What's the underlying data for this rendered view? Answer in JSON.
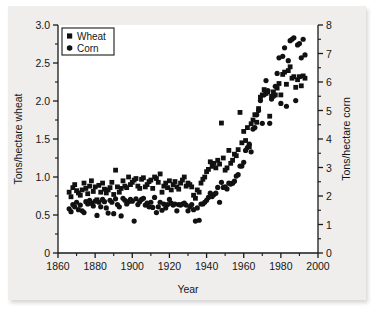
{
  "figure": {
    "background_color": "#efeeec",
    "plot_background_color": "#ffffff",
    "marker_color": "#111111"
  },
  "legend": {
    "position": "top-left-inside",
    "entries": [
      {
        "label": "Wheat",
        "marker": "square"
      },
      {
        "label": "Corn",
        "marker": "circle"
      }
    ]
  },
  "axes": {
    "x": {
      "label": "Year",
      "ticks": [
        "1860",
        "1880",
        "1900",
        "1920",
        "1940",
        "1960",
        "1980",
        "2000"
      ],
      "tick_values": [
        1860,
        1880,
        1900,
        1920,
        1940,
        1960,
        1980,
        2000
      ],
      "minor_step": 10,
      "range": [
        1860,
        2000
      ]
    },
    "y_left": {
      "label": "Tons/hectare wheat",
      "ticks": [
        "0",
        "0.5",
        "1.0",
        "1.5",
        "2.0",
        "2.5",
        "3.0"
      ],
      "tick_values": [
        0,
        0.5,
        1.0,
        1.5,
        2.0,
        2.5,
        3.0
      ],
      "minor_step": 0.25,
      "range": [
        0,
        3.0
      ]
    },
    "y_right": {
      "label": "Tons/hectare corn",
      "ticks": [
        "0",
        "1",
        "2",
        "3",
        "4",
        "5",
        "6",
        "7",
        "8"
      ],
      "tick_values": [
        0,
        1,
        2,
        3,
        4,
        5,
        6,
        7,
        8
      ],
      "minor_step": 0.5,
      "range": [
        0,
        8
      ]
    }
  },
  "chart_data": {
    "type": "scatter",
    "title": "",
    "xlabel": "Year",
    "ylabel": "Tons/hectare wheat",
    "ylabel_secondary": "Tons/hectare corn",
    "xlim": [
      1860,
      2000
    ],
    "ylim": [
      0,
      3.0
    ],
    "ylim_secondary": [
      0,
      8
    ],
    "grid": false,
    "legend_position": "upper left",
    "series": [
      {
        "name": "Wheat",
        "marker": "square",
        "axis": "left",
        "units": "tons/hectare",
        "points": [
          [
            1866,
            0.8
          ],
          [
            1867,
            0.74
          ],
          [
            1868,
            0.86
          ],
          [
            1869,
            0.9
          ],
          [
            1870,
            0.82
          ],
          [
            1871,
            0.79
          ],
          [
            1872,
            0.76
          ],
          [
            1873,
            0.83
          ],
          [
            1874,
            0.92
          ],
          [
            1875,
            0.85
          ],
          [
            1876,
            0.78
          ],
          [
            1877,
            0.88
          ],
          [
            1878,
            0.95
          ],
          [
            1879,
            0.81
          ],
          [
            1880,
            0.87
          ],
          [
            1881,
            0.7
          ],
          [
            1882,
            0.89
          ],
          [
            1883,
            0.8
          ],
          [
            1884,
            0.92
          ],
          [
            1885,
            0.84
          ],
          [
            1886,
            0.79
          ],
          [
            1887,
            0.83
          ],
          [
            1888,
            0.86
          ],
          [
            1889,
            0.93
          ],
          [
            1890,
            0.77
          ],
          [
            1891,
            1.09
          ],
          [
            1892,
            0.87
          ],
          [
            1893,
            0.8
          ],
          [
            1894,
            0.85
          ],
          [
            1895,
            0.95
          ],
          [
            1896,
            0.88
          ],
          [
            1897,
            0.86
          ],
          [
            1898,
            1.0
          ],
          [
            1899,
            0.9
          ],
          [
            1900,
            0.93
          ],
          [
            1901,
            0.96
          ],
          [
            1902,
            0.98
          ],
          [
            1903,
            0.88
          ],
          [
            1904,
            0.85
          ],
          [
            1905,
            0.97
          ],
          [
            1906,
            0.99
          ],
          [
            1907,
            0.87
          ],
          [
            1908,
            0.9
          ],
          [
            1909,
            0.94
          ],
          [
            1910,
            0.96
          ],
          [
            1911,
            0.85
          ],
          [
            1912,
            1.0
          ],
          [
            1913,
            0.98
          ],
          [
            1914,
            0.93
          ],
          [
            1915,
            1.04
          ],
          [
            1916,
            0.8
          ],
          [
            1917,
            0.88
          ],
          [
            1918,
            0.92
          ],
          [
            1919,
            0.86
          ],
          [
            1920,
            0.95
          ],
          [
            1921,
            0.83
          ],
          [
            1922,
            0.9
          ],
          [
            1923,
            0.94
          ],
          [
            1924,
            0.87
          ],
          [
            1925,
            0.84
          ],
          [
            1926,
            0.92
          ],
          [
            1927,
            0.96
          ],
          [
            1928,
            1.0
          ],
          [
            1929,
            0.88
          ],
          [
            1930,
            0.92
          ],
          [
            1931,
            0.9
          ],
          [
            1932,
            0.87
          ],
          [
            1933,
            0.76
          ],
          [
            1934,
            0.72
          ],
          [
            1935,
            0.83
          ],
          [
            1936,
            0.8
          ],
          [
            1937,
            0.92
          ],
          [
            1938,
            0.97
          ],
          [
            1939,
            1.0
          ],
          [
            1940,
            1.07
          ],
          [
            1941,
            1.1
          ],
          [
            1942,
            1.2
          ],
          [
            1943,
            1.14
          ],
          [
            1944,
            1.18
          ],
          [
            1945,
            1.12
          ],
          [
            1946,
            1.22
          ],
          [
            1947,
            1.17
          ],
          [
            1948,
            1.71
          ],
          [
            1949,
            1.25
          ],
          [
            1950,
            1.09
          ],
          [
            1951,
            1.12
          ],
          [
            1952,
            1.35
          ],
          [
            1953,
            1.18
          ],
          [
            1954,
            1.22
          ],
          [
            1955,
            1.3
          ],
          [
            1956,
            1.28
          ],
          [
            1957,
            1.36
          ],
          [
            1958,
            1.85
          ],
          [
            1959,
            1.45
          ],
          [
            1960,
            1.6
          ],
          [
            1961,
            1.48
          ],
          [
            1962,
            1.65
          ],
          [
            1963,
            1.4
          ],
          [
            1964,
            1.7
          ],
          [
            1965,
            1.75
          ],
          [
            1966,
            1.82
          ],
          [
            1967,
            1.72
          ],
          [
            1968,
            1.9
          ],
          [
            1969,
            2.05
          ],
          [
            1970,
            2.08
          ],
          [
            1971,
            2.15
          ],
          [
            1972,
            2.1
          ],
          [
            1973,
            2.12
          ],
          [
            1974,
            1.8
          ],
          [
            1975,
            2.06
          ],
          [
            1976,
            2.12
          ],
          [
            1977,
            2.08
          ],
          [
            1978,
            2.17
          ],
          [
            1979,
            2.23
          ],
          [
            1980,
            2.08
          ],
          [
            1981,
            2.35
          ],
          [
            1982,
            2.38
          ],
          [
            1983,
            2.22
          ],
          [
            1984,
            2.4
          ],
          [
            1985,
            2.45
          ],
          [
            1986,
            2.3
          ],
          [
            1987,
            2.32
          ],
          [
            1988,
            2.18
          ],
          [
            1989,
            2.28
          ],
          [
            1990,
            2.32
          ],
          [
            1991,
            2.2
          ],
          [
            1992,
            2.33
          ],
          [
            1993,
            2.3
          ]
        ]
      },
      {
        "name": "Corn",
        "marker": "circle",
        "axis": "right",
        "units": "tons/hectare",
        "points": [
          [
            1866,
            1.55
          ],
          [
            1867,
            1.45
          ],
          [
            1868,
            1.7
          ],
          [
            1869,
            1.62
          ],
          [
            1870,
            1.78
          ],
          [
            1871,
            1.52
          ],
          [
            1872,
            1.68
          ],
          [
            1873,
            1.48
          ],
          [
            1874,
            1.42
          ],
          [
            1875,
            1.8
          ],
          [
            1876,
            1.72
          ],
          [
            1877,
            1.85
          ],
          [
            1878,
            1.75
          ],
          [
            1879,
            1.65
          ],
          [
            1880,
            1.82
          ],
          [
            1881,
            1.32
          ],
          [
            1882,
            1.78
          ],
          [
            1883,
            1.62
          ],
          [
            1884,
            1.88
          ],
          [
            1885,
            1.8
          ],
          [
            1886,
            1.58
          ],
          [
            1887,
            1.4
          ],
          [
            1888,
            1.85
          ],
          [
            1889,
            1.78
          ],
          [
            1890,
            1.38
          ],
          [
            1891,
            1.9
          ],
          [
            1892,
            1.7
          ],
          [
            1893,
            1.62
          ],
          [
            1894,
            1.3
          ],
          [
            1895,
            1.92
          ],
          [
            1896,
            1.85
          ],
          [
            1897,
            1.72
          ],
          [
            1898,
            1.8
          ],
          [
            1899,
            1.88
          ],
          [
            1900,
            1.82
          ],
          [
            1901,
            1.12
          ],
          [
            1902,
            1.9
          ],
          [
            1903,
            1.7
          ],
          [
            1904,
            1.8
          ],
          [
            1905,
            1.88
          ],
          [
            1906,
            1.92
          ],
          [
            1907,
            1.68
          ],
          [
            1908,
            1.75
          ],
          [
            1909,
            1.62
          ],
          [
            1910,
            1.78
          ],
          [
            1911,
            1.6
          ],
          [
            1912,
            1.95
          ],
          [
            1913,
            1.42
          ],
          [
            1914,
            1.62
          ],
          [
            1915,
            1.78
          ],
          [
            1916,
            1.5
          ],
          [
            1917,
            1.72
          ],
          [
            1918,
            1.58
          ],
          [
            1919,
            1.7
          ],
          [
            1920,
            1.88
          ],
          [
            1921,
            1.75
          ],
          [
            1922,
            1.68
          ],
          [
            1923,
            1.72
          ],
          [
            1924,
            1.48
          ],
          [
            1925,
            1.7
          ],
          [
            1926,
            1.68
          ],
          [
            1927,
            1.72
          ],
          [
            1928,
            1.75
          ],
          [
            1929,
            1.68
          ],
          [
            1930,
            1.48
          ],
          [
            1931,
            1.62
          ],
          [
            1932,
            1.7
          ],
          [
            1933,
            1.52
          ],
          [
            1934,
            1.12
          ],
          [
            1935,
            1.58
          ],
          [
            1936,
            1.15
          ],
          [
            1937,
            1.72
          ],
          [
            1938,
            1.72
          ],
          [
            1939,
            1.78
          ],
          [
            1940,
            1.85
          ],
          [
            1941,
            1.95
          ],
          [
            1942,
            2.1
          ],
          [
            1943,
            1.98
          ],
          [
            1944,
            2.05
          ],
          [
            1945,
            2.1
          ],
          [
            1946,
            2.3
          ],
          [
            1947,
            1.78
          ],
          [
            1948,
            2.48
          ],
          [
            1949,
            2.3
          ],
          [
            1950,
            2.32
          ],
          [
            1951,
            2.25
          ],
          [
            1952,
            2.45
          ],
          [
            1953,
            2.42
          ],
          [
            1954,
            2.45
          ],
          [
            1955,
            2.52
          ],
          [
            1956,
            2.7
          ],
          [
            1957,
            2.75
          ],
          [
            1958,
            3.05
          ],
          [
            1959,
            3.05
          ],
          [
            1960,
            3.18
          ],
          [
            1961,
            3.6
          ],
          [
            1962,
            3.7
          ],
          [
            1963,
            3.82
          ],
          [
            1964,
            3.55
          ],
          [
            1965,
            4.35
          ],
          [
            1966,
            4.4
          ],
          [
            1967,
            4.85
          ],
          [
            1968,
            5.0
          ],
          [
            1969,
            5.35
          ],
          [
            1970,
            4.55
          ],
          [
            1971,
            5.55
          ],
          [
            1972,
            6.05
          ],
          [
            1973,
            5.7
          ],
          [
            1974,
            4.55
          ],
          [
            1975,
            5.4
          ],
          [
            1976,
            5.5
          ],
          [
            1977,
            5.85
          ],
          [
            1978,
            6.3
          ],
          [
            1979,
            6.85
          ],
          [
            1980,
            5.25
          ],
          [
            1981,
            6.9
          ],
          [
            1982,
            7.2
          ],
          [
            1983,
            5.15
          ],
          [
            1984,
            6.75
          ],
          [
            1985,
            7.45
          ],
          [
            1986,
            7.5
          ],
          [
            1987,
            7.55
          ],
          [
            1988,
            5.35
          ],
          [
            1989,
            7.3
          ],
          [
            1990,
            7.35
          ],
          [
            1991,
            6.85
          ],
          [
            1992,
            7.5
          ],
          [
            1993,
            6.95
          ]
        ]
      }
    ]
  }
}
